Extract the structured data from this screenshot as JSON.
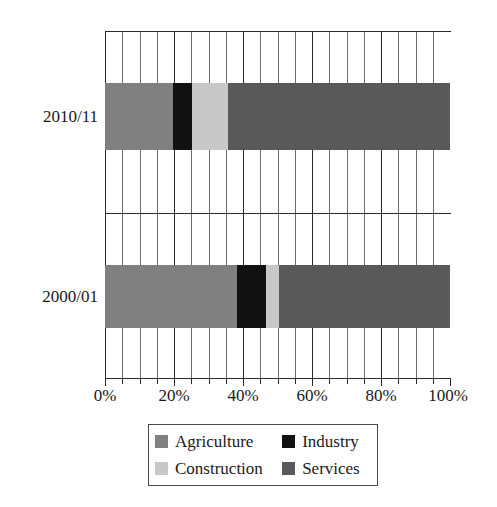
{
  "chart_data": {
    "type": "bar",
    "orientation": "horizontal",
    "stacked": true,
    "normalized": true,
    "title": "",
    "subtitle": "",
    "xlabel": "",
    "ylabel": "",
    "categories": [
      "2010/11",
      "2000/01"
    ],
    "category_order_top_to_bottom": [
      "2010/11",
      "2000/01"
    ],
    "series": [
      {
        "name": "Agriculture",
        "color": "#808080",
        "values": [
          19.7,
          38.3
        ]
      },
      {
        "name": "Industry",
        "color": "#111111",
        "values": [
          5.5,
          8.4
        ]
      },
      {
        "name": "Construction",
        "color": "#c8c8c8",
        "values": [
          10.5,
          3.7
        ]
      },
      {
        "name": "Services",
        "color": "#595959",
        "values": [
          64.3,
          49.6
        ]
      }
    ],
    "xlim": [
      0,
      100
    ],
    "xticks": [
      0,
      20,
      40,
      60,
      80,
      100
    ],
    "xtick_labels": [
      "0%",
      "20%",
      "40%",
      "60%",
      "80%",
      "100%"
    ],
    "xminor_tick_step": 5,
    "grid": true,
    "grid_axis": "x",
    "legend": {
      "position": "bottom",
      "boxed": true,
      "columns": 2,
      "entries": [
        {
          "label": "Agriculture",
          "swatch": "#808080"
        },
        {
          "label": "Industry",
          "swatch": "#111111"
        },
        {
          "label": "Construction",
          "swatch": "#c8c8c8"
        },
        {
          "label": "Services",
          "swatch": "#595959"
        }
      ]
    },
    "annotations": []
  },
  "axis": {
    "x_tick_labels": {
      "t0": "0%",
      "t1": "20%",
      "t2": "40%",
      "t3": "60%",
      "t4": "80%",
      "t5": "100%"
    },
    "y_tick_labels": {
      "row0": "2010/11",
      "row1": "2000/01"
    }
  },
  "legend": {
    "items": [
      {
        "label": "Agriculture"
      },
      {
        "label": "Industry"
      },
      {
        "label": "Construction"
      },
      {
        "label": "Services"
      }
    ]
  },
  "colors": {
    "agriculture": "#808080",
    "industry": "#111111",
    "construction": "#c8c8c8",
    "services": "#595959",
    "axis": "#2b2b2b",
    "grid": "#6b6b6b",
    "background": "#ffffff"
  }
}
